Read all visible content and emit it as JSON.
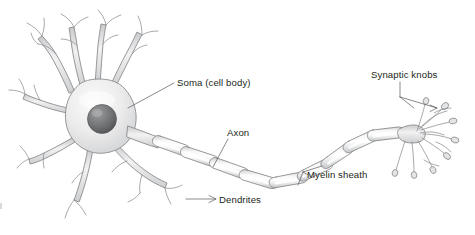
{
  "figure": {
    "background_color": "#ffffff",
    "line_color": "#8b8c8e",
    "text_color": "#231f20",
    "fill_light": "#ededee",
    "fill_mid": "#d9dadb",
    "nucleus_color": "#6d6e70"
  },
  "labels": {
    "soma": "Soma (cell body)",
    "axon": "Axon",
    "myelin": "Myelin sheath",
    "dendrites": "Dendrites",
    "synaptic_knobs": "Synaptic knobs"
  },
  "parts": {
    "soma_label_target": "cell body",
    "axon_label_target": "axon shaft",
    "myelin_label_target": "myelin segments",
    "dendrites_label_target": "dendrite branches",
    "knobs_label_target": "synaptic terminal bulbs"
  },
  "counts": {
    "myelin_segments": 9,
    "dendrite_trunks": 6,
    "terminal_branches": 10
  }
}
